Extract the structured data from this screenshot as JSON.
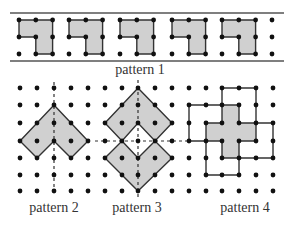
{
  "figure": {
    "colors": {
      "fill": "#d0d0d0",
      "stroke": "#333333",
      "dot": "#111111",
      "rule": "#555555"
    },
    "labels": {
      "pattern1": "pattern 1",
      "pattern2": "pattern 2",
      "pattern3": "pattern 3",
      "pattern4": "pattern 4"
    },
    "pattern1": {
      "rows_y": [
        20,
        37,
        54
      ],
      "tile_starts_x": [
        19,
        69,
        120,
        172,
        222
      ],
      "spacing": 16.8,
      "trailing_column_x": 272,
      "rule_top_y": 13,
      "rule_bottom_y": 61,
      "tile_count": 5
    },
    "grid": {
      "cols_x": [
        20,
        37,
        54,
        71,
        88,
        105,
        122,
        138,
        155,
        172,
        189,
        206,
        222,
        239,
        256,
        273
      ],
      "rows_y": [
        88,
        105,
        123,
        141,
        158,
        175,
        191
      ]
    },
    "pattern2": {
      "axis_col": 2,
      "polygon": [
        [
          2,
          1
        ],
        [
          4,
          3
        ],
        [
          3,
          4
        ],
        [
          2,
          3
        ],
        [
          1,
          4
        ],
        [
          0,
          3
        ]
      ]
    },
    "pattern3": {
      "axis_col": 7,
      "axis_row": 3,
      "upper": [
        [
          7,
          0
        ],
        [
          9,
          2
        ],
        [
          8,
          3
        ],
        [
          7,
          2
        ],
        [
          6,
          3
        ],
        [
          5,
          2
        ]
      ],
      "lower": [
        [
          6,
          3
        ],
        [
          7,
          4
        ],
        [
          8,
          3
        ],
        [
          9,
          4
        ],
        [
          7,
          6
        ],
        [
          5,
          4
        ]
      ]
    },
    "pattern4": {
      "cross": [
        [
          12,
          1
        ],
        [
          13,
          1
        ],
        [
          13,
          2
        ],
        [
          14,
          2
        ],
        [
          14,
          3
        ],
        [
          13,
          3
        ],
        [
          13,
          4
        ],
        [
          12,
          4
        ],
        [
          12,
          3
        ],
        [
          11,
          3
        ],
        [
          11,
          2
        ],
        [
          12,
          2
        ]
      ],
      "outlines": [
        [
          [
            12,
            1
          ],
          [
            12,
            0
          ],
          [
            14,
            0
          ],
          [
            14,
            2
          ]
        ],
        [
          [
            12,
            1
          ],
          [
            10,
            1
          ],
          [
            10,
            3
          ],
          [
            11,
            3
          ]
        ],
        [
          [
            14,
            2
          ],
          [
            15,
            2
          ],
          [
            15,
            4
          ],
          [
            13,
            4
          ]
        ],
        [
          [
            11,
            3
          ],
          [
            11,
            5
          ],
          [
            13,
            5
          ],
          [
            13,
            4
          ]
        ]
      ]
    }
  }
}
